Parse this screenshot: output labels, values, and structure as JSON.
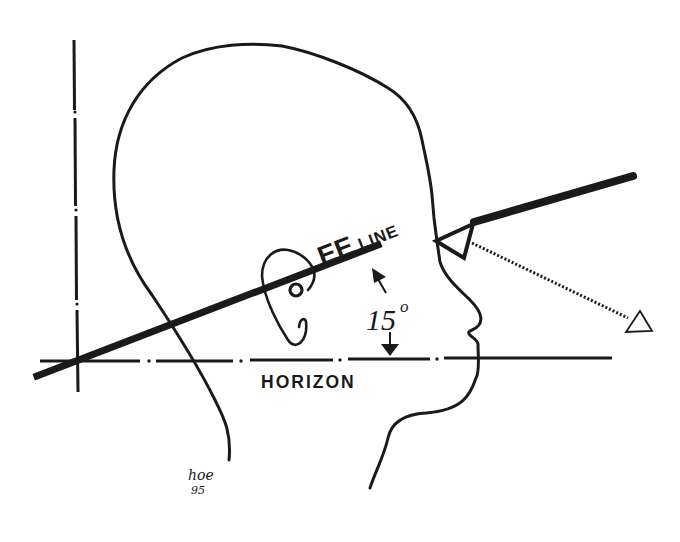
{
  "diagram": {
    "type": "head-profile-sightline",
    "labels": {
      "ee_big": "EE",
      "ee_small": "LINE",
      "angle": "15",
      "angle_unit": "o",
      "horizon": "HORIZON",
      "signature": "hoe",
      "signature_year": "95"
    },
    "angle_between_ee_line_and_horizon_deg": 15,
    "colors": {
      "ink": "#1a1a1a",
      "background": "#ffffff"
    },
    "elements": [
      "vertical-reference-line",
      "horizon-line",
      "ee-line",
      "head-outline",
      "ear",
      "ear-pivot-point",
      "eye-triangle",
      "sight-line",
      "target-triangle",
      "angle-arrows"
    ]
  }
}
